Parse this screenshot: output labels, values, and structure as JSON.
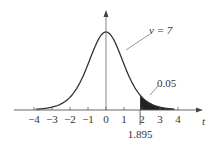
{
  "chart_data": {
    "type": "area",
    "title": "",
    "xlabel": "t",
    "ylabel": "",
    "distribution": "Student t",
    "degrees_of_freedom_label": "v = 7",
    "degrees_of_freedom": 7,
    "x_ticks": [
      "-4",
      "-3",
      "-2",
      "-1",
      "0",
      "1",
      "2",
      "3",
      "4"
    ],
    "x_tick_values": [
      -4,
      -3,
      -2,
      -1,
      0,
      1,
      2,
      3,
      4
    ],
    "xlim": [
      -4.5,
      4.6
    ],
    "critical_value": 1.895,
    "critical_value_label": "1.895",
    "shaded_region": {
      "from": 1.895,
      "to": "inf",
      "area": 0.05,
      "label": "0.05"
    },
    "grid": false,
    "legend": null
  }
}
